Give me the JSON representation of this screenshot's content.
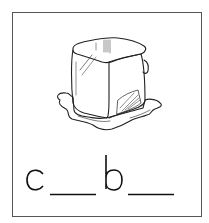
{
  "worksheet": {
    "picture": {
      "subject": "melting ice cube",
      "icon": "ice-cube-icon"
    },
    "word_puzzle": {
      "letters": [
        "c",
        "b"
      ],
      "pattern": "c__b__",
      "blanks": 2,
      "answer_hidden": true
    },
    "colors": {
      "line": "#222222",
      "border": "#555555",
      "background": "#ffffff"
    }
  }
}
